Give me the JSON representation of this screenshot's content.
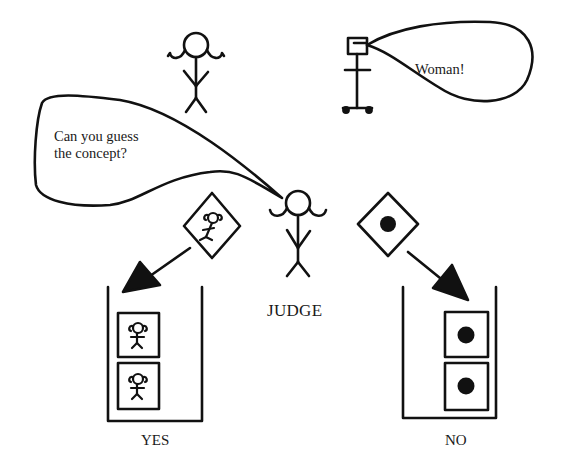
{
  "figure": {
    "colors": {
      "ink": "#111111",
      "paper": "#ffffff"
    }
  },
  "characters": {
    "teacher": {
      "icon": "stick-figure-woman-icon"
    },
    "robot": {
      "icon": "robot-on-wheels-icon",
      "speech": "Woman!"
    },
    "judge": {
      "icon": "stick-figure-woman-icon",
      "label": "JUDGE",
      "speech_line1": "Can you guess",
      "speech_line2": "the concept?"
    }
  },
  "examples": {
    "positive": {
      "icon": "woman-figure-icon",
      "arrow": "arrow-down-left"
    },
    "negative": {
      "icon": "black-dot-icon",
      "arrow": "arrow-down-right"
    }
  },
  "bins": [
    {
      "label": "YES",
      "items": [
        "woman-figure",
        "woman-figure"
      ]
    },
    {
      "label": "NO",
      "items": [
        "black-dot",
        "black-dot"
      ]
    }
  ]
}
